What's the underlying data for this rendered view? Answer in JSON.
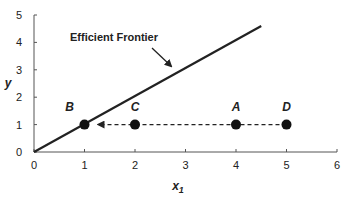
{
  "chart_data": {
    "type": "scatter",
    "title": "",
    "xlabel": "x1",
    "xlabel_main": "x",
    "xlabel_sub": "1",
    "ylabel": "y",
    "xlim": [
      0,
      6
    ],
    "ylim": [
      0,
      5
    ],
    "x_ticks": [
      0,
      1,
      2,
      3,
      4,
      5,
      6
    ],
    "y_ticks": [
      0,
      1,
      2,
      3,
      4,
      5
    ],
    "grid": false,
    "series": [
      {
        "name": "Efficient Frontier",
        "kind": "line",
        "x": [
          0,
          4.5
        ],
        "y": [
          0,
          4.6
        ]
      },
      {
        "name": "Points",
        "kind": "scatter",
        "points": [
          {
            "label": "B",
            "x": 1,
            "y": 1
          },
          {
            "label": "C",
            "x": 2,
            "y": 1
          },
          {
            "label": "A",
            "x": 4,
            "y": 1
          },
          {
            "label": "D",
            "x": 5,
            "y": 1
          }
        ]
      },
      {
        "name": "Projection",
        "kind": "dashed-arrow",
        "from": {
          "x": 5,
          "y": 1
        },
        "to": {
          "x": 1,
          "y": 1
        }
      }
    ],
    "annotations": [
      {
        "text": "Efficient Frontier",
        "arrow_to": {
          "x": 2.7,
          "y": 2.9
        }
      }
    ]
  },
  "colors": {
    "line": "#222222",
    "axis": "#555555",
    "points": "#111111"
  }
}
